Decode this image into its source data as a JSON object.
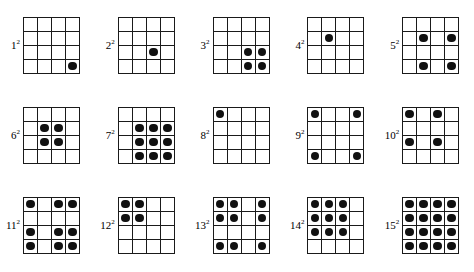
{
  "figure": {
    "type": "dot-grid-diagram",
    "grid_rows": 4,
    "grid_cols": 4,
    "dot_color": "#111111",
    "line_color": "#1a1a1a",
    "background_color": "#ffffff",
    "label_suffix": "2"
  },
  "grids": [
    {
      "id": "grid-1",
      "label_base": "1",
      "label_exponent": "2",
      "label_text": "1²",
      "dot_count": 1,
      "filled_cells": [
        [
          4,
          4
        ]
      ]
    },
    {
      "id": "grid-2",
      "label_base": "2",
      "label_exponent": "2",
      "label_text": "2²",
      "dot_count": 1,
      "filled_cells": [
        [
          3,
          3
        ]
      ]
    },
    {
      "id": "grid-3",
      "label_base": "3",
      "label_exponent": "2",
      "label_text": "3²",
      "dot_count": 4,
      "filled_cells": [
        [
          3,
          3
        ],
        [
          3,
          4
        ],
        [
          4,
          3
        ],
        [
          4,
          4
        ]
      ]
    },
    {
      "id": "grid-4",
      "label_base": "4",
      "label_exponent": "2",
      "label_text": "4²",
      "dot_count": 1,
      "filled_cells": [
        [
          2,
          2
        ]
      ]
    },
    {
      "id": "grid-5",
      "label_base": "5",
      "label_exponent": "2",
      "label_text": "5²",
      "dot_count": 4,
      "filled_cells": [
        [
          2,
          2
        ],
        [
          2,
          4
        ],
        [
          4,
          2
        ],
        [
          4,
          4
        ]
      ]
    },
    {
      "id": "grid-6",
      "label_base": "6",
      "label_exponent": "2",
      "label_text": "6²",
      "dot_count": 4,
      "filled_cells": [
        [
          2,
          2
        ],
        [
          2,
          3
        ],
        [
          3,
          2
        ],
        [
          3,
          3
        ]
      ]
    },
    {
      "id": "grid-7",
      "label_base": "7",
      "label_exponent": "2",
      "label_text": "7²",
      "dot_count": 9,
      "filled_cells": [
        [
          2,
          2
        ],
        [
          2,
          3
        ],
        [
          2,
          4
        ],
        [
          3,
          2
        ],
        [
          3,
          3
        ],
        [
          3,
          4
        ],
        [
          4,
          2
        ],
        [
          4,
          3
        ],
        [
          4,
          4
        ]
      ]
    },
    {
      "id": "grid-8",
      "label_base": "8",
      "label_exponent": "2",
      "label_text": "8²",
      "dot_count": 1,
      "filled_cells": [
        [
          1,
          1
        ]
      ]
    },
    {
      "id": "grid-9",
      "label_base": "9",
      "label_exponent": "2",
      "label_text": "9²",
      "dot_count": 4,
      "filled_cells": [
        [
          1,
          1
        ],
        [
          1,
          4
        ],
        [
          4,
          1
        ],
        [
          4,
          4
        ]
      ]
    },
    {
      "id": "grid-10",
      "label_base": "10",
      "label_exponent": "2",
      "label_text": "10²",
      "dot_count": 4,
      "filled_cells": [
        [
          1,
          1
        ],
        [
          1,
          3
        ],
        [
          3,
          1
        ],
        [
          3,
          3
        ]
      ]
    },
    {
      "id": "grid-11",
      "label_base": "11",
      "label_exponent": "2",
      "label_text": "11²",
      "dot_count": 9,
      "filled_cells": [
        [
          1,
          1
        ],
        [
          1,
          3
        ],
        [
          1,
          4
        ],
        [
          3,
          1
        ],
        [
          3,
          3
        ],
        [
          3,
          4
        ],
        [
          4,
          1
        ],
        [
          4,
          3
        ],
        [
          4,
          4
        ]
      ]
    },
    {
      "id": "grid-12",
      "label_base": "12",
      "label_exponent": "2",
      "label_text": "12²",
      "dot_count": 4,
      "filled_cells": [
        [
          1,
          1
        ],
        [
          1,
          2
        ],
        [
          2,
          1
        ],
        [
          2,
          2
        ]
      ]
    },
    {
      "id": "grid-13",
      "label_base": "13",
      "label_exponent": "2",
      "label_text": "13²",
      "dot_count": 9,
      "filled_cells": [
        [
          1,
          1
        ],
        [
          1,
          2
        ],
        [
          1,
          4
        ],
        [
          2,
          1
        ],
        [
          2,
          2
        ],
        [
          2,
          4
        ],
        [
          4,
          1
        ],
        [
          4,
          2
        ],
        [
          4,
          4
        ]
      ]
    },
    {
      "id": "grid-14",
      "label_base": "14",
      "label_exponent": "2",
      "label_text": "14²",
      "dot_count": 9,
      "filled_cells": [
        [
          1,
          1
        ],
        [
          1,
          2
        ],
        [
          1,
          3
        ],
        [
          2,
          1
        ],
        [
          2,
          2
        ],
        [
          2,
          3
        ],
        [
          3,
          1
        ],
        [
          3,
          2
        ],
        [
          3,
          3
        ]
      ]
    },
    {
      "id": "grid-15",
      "label_base": "15",
      "label_exponent": "2",
      "label_text": "15²",
      "dot_count": 16,
      "filled_cells": [
        [
          1,
          1
        ],
        [
          1,
          2
        ],
        [
          1,
          3
        ],
        [
          1,
          4
        ],
        [
          2,
          1
        ],
        [
          2,
          2
        ],
        [
          2,
          3
        ],
        [
          2,
          4
        ],
        [
          3,
          1
        ],
        [
          3,
          2
        ],
        [
          3,
          3
        ],
        [
          3,
          4
        ],
        [
          4,
          1
        ],
        [
          4,
          2
        ],
        [
          4,
          3
        ],
        [
          4,
          4
        ]
      ]
    }
  ],
  "layout": {
    "rows": 3,
    "columns": 5,
    "grid_order": [
      [
        "grid-1",
        "grid-2",
        "grid-3",
        "grid-4",
        "grid-5"
      ],
      [
        "grid-6",
        "grid-7",
        "grid-8",
        "grid-9",
        "grid-10"
      ],
      [
        "grid-11",
        "grid-12",
        "grid-13",
        "grid-14",
        "grid-15"
      ]
    ]
  }
}
